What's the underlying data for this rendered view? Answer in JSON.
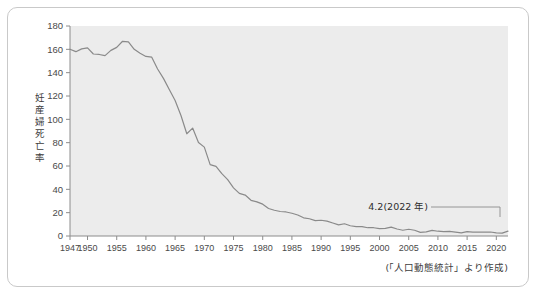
{
  "card": {
    "source_note": "(「人口動態統計」より作成)"
  },
  "chart_data": {
    "type": "line",
    "title": "",
    "subtitle": "",
    "xlabel": "",
    "ylabel": "妊産婦死亡率",
    "ylabel_chars": [
      "妊",
      "産",
      "婦",
      "死",
      "亡",
      "率"
    ],
    "xlim": [
      1947,
      2022
    ],
    "ylim": [
      0,
      180
    ],
    "ytick_values": [
      0,
      20,
      40,
      60,
      80,
      100,
      120,
      140,
      160,
      180
    ],
    "ytick_labels": [
      "0",
      "20",
      "40",
      "60",
      "80",
      "100",
      "120",
      "140",
      "160",
      "180"
    ],
    "xtick_values": [
      1947,
      1950,
      1955,
      1960,
      1965,
      1970,
      1975,
      1980,
      1985,
      1990,
      1995,
      2000,
      2005,
      2010,
      2015,
      2020
    ],
    "xtick_labels": [
      "1947",
      "1950",
      "1955",
      "1960",
      "1965",
      "1970",
      "1975",
      "1980",
      "1985",
      "1990",
      "1995",
      "2000",
      "2005",
      "2010",
      "2015",
      "2020"
    ],
    "grid": false,
    "legend": false,
    "line_color": "#8a8a8a",
    "plot_bg_color": "#ececec",
    "series": [
      {
        "name": "妊産婦死亡率",
        "x": [
          1947,
          1948,
          1949,
          1950,
          1951,
          1952,
          1953,
          1954,
          1955,
          1956,
          1957,
          1958,
          1959,
          1960,
          1961,
          1962,
          1963,
          1964,
          1965,
          1966,
          1967,
          1968,
          1969,
          1970,
          1971,
          1972,
          1973,
          1974,
          1975,
          1976,
          1977,
          1978,
          1979,
          1980,
          1981,
          1982,
          1983,
          1984,
          1985,
          1986,
          1987,
          1988,
          1989,
          1990,
          1991,
          1992,
          1993,
          1994,
          1995,
          1996,
          1997,
          1998,
          1999,
          2000,
          2001,
          2002,
          2003,
          2004,
          2005,
          2006,
          2007,
          2008,
          2009,
          2010,
          2011,
          2012,
          2013,
          2014,
          2015,
          2016,
          2017,
          2018,
          2019,
          2020,
          2021,
          2022
        ],
        "values": [
          160.1,
          158.0,
          160.4,
          161.2,
          156.0,
          155.6,
          154.6,
          159.1,
          161.7,
          166.9,
          166.4,
          160.0,
          156.6,
          153.9,
          153.3,
          143.1,
          135.1,
          125.6,
          116.2,
          103.3,
          87.6,
          92.5,
          80.2,
          76.2,
          61.2,
          59.7,
          53.4,
          48.3,
          41.3,
          36.5,
          35.1,
          30.6,
          29.3,
          27.3,
          23.6,
          22.1,
          21.0,
          20.6,
          19.5,
          18.0,
          15.6,
          14.8,
          13.2,
          13.5,
          12.8,
          11.1,
          9.5,
          10.5,
          8.8,
          8.0,
          8.1,
          7.1,
          7.1,
          6.3,
          6.5,
          7.6,
          6.0,
          4.9,
          5.8,
          4.9,
          3.1,
          3.5,
          4.8,
          4.1,
          3.8,
          4.0,
          3.4,
          2.7,
          3.8,
          3.4,
          3.4,
          3.3,
          3.4,
          2.7,
          2.5,
          4.2
        ]
      }
    ],
    "annotations": [
      {
        "text": "4.2(2022 年)",
        "x": 2022,
        "y": 4.2
      }
    ]
  }
}
